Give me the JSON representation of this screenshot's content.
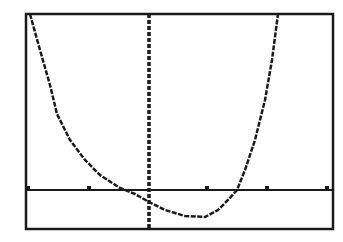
{
  "screen": {
    "type": "graphing-calculator-display",
    "background": "#ffffff",
    "ink": "#1a1a1a"
  },
  "chart_data": {
    "type": "line",
    "title": "",
    "xlabel": "",
    "ylabel": "",
    "grid": false,
    "legend": "none",
    "window_px": {
      "left": 26,
      "top": 14,
      "right": 333,
      "bottom": 229
    },
    "axes_px": {
      "x_axis_y": 190,
      "y_axis_x": 149
    },
    "x_ticks_px": [
      28,
      89,
      207,
      267,
      327
    ],
    "series": [
      {
        "name": "Y1",
        "points_px": [
          [
            30,
            14
          ],
          [
            40,
            50
          ],
          [
            50,
            85
          ],
          [
            57,
            114
          ],
          [
            70,
            140
          ],
          [
            85,
            160
          ],
          [
            100,
            175
          ],
          [
            120,
            188
          ],
          [
            135,
            194
          ],
          [
            149,
            202
          ],
          [
            165,
            210
          ],
          [
            185,
            216
          ],
          [
            205,
            217
          ],
          [
            218,
            210
          ],
          [
            228,
            200
          ],
          [
            237,
            190
          ],
          [
            245,
            170
          ],
          [
            255,
            140
          ],
          [
            265,
            100
          ],
          [
            272,
            60
          ],
          [
            278,
            14
          ]
        ]
      }
    ]
  }
}
